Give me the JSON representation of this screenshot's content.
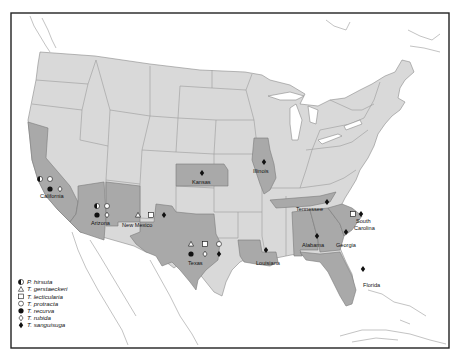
{
  "map": {
    "title": "",
    "species": [
      {
        "key": "hirsuta",
        "name": "P. hirsuta",
        "symbol": "half-circle"
      },
      {
        "key": "gerstaeckeri",
        "name": "T. gerstaeckeri",
        "symbol": "open-triangle"
      },
      {
        "key": "lecticularia",
        "name": "T. lecticularia",
        "symbol": "open-square"
      },
      {
        "key": "protracta",
        "name": "T. protracta",
        "symbol": "open-circle"
      },
      {
        "key": "recurva",
        "name": "T. recurva",
        "symbol": "filled-circle"
      },
      {
        "key": "rubida",
        "name": "T. rubida",
        "symbol": "open-diamond"
      },
      {
        "key": "sanguisuga",
        "name": "T. sanguisuga",
        "symbol": "filled-diamond"
      }
    ],
    "states": [
      {
        "name": "California",
        "species": [
          "hirsuta",
          "protracta",
          "recurva",
          "rubida"
        ]
      },
      {
        "name": "Arizona",
        "species": [
          "hirsuta",
          "protracta",
          "recurva",
          "rubida"
        ]
      },
      {
        "name": "New Mexico",
        "species": [
          "gerstaeckeri",
          "lecticularia",
          "sanguisuga"
        ]
      },
      {
        "name": "Texas",
        "species": [
          "gerstaeckeri",
          "lecticularia",
          "protracta",
          "recurva",
          "rubida",
          "sanguisuga"
        ]
      },
      {
        "name": "Kansas",
        "species": [
          "sanguisuga"
        ]
      },
      {
        "name": "Illinois",
        "species": [
          "sanguisuga"
        ]
      },
      {
        "name": "Louisiana",
        "species": [
          "sanguisuga"
        ]
      },
      {
        "name": "Tennessee",
        "species": [
          "sanguisuga"
        ]
      },
      {
        "name": "Alabama",
        "species": [
          "sanguisuga"
        ]
      },
      {
        "name": "Georgia",
        "species": [
          "sanguisuga"
        ]
      },
      {
        "name": "South Carolina",
        "species": [
          "lecticularia",
          "sanguisuga"
        ]
      },
      {
        "name": "Florida",
        "species": [
          "sanguisuga"
        ]
      }
    ],
    "colors": {
      "highlighted_state": "#a9a9a9",
      "other_state": "#d9d9d9",
      "water": "#ffffff",
      "marker": "#111111"
    }
  }
}
